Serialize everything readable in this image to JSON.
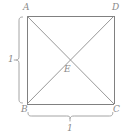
{
  "figure": {
    "kind": "geometry-diagram",
    "background_color": "#ffffff",
    "stroke_color": "#808080",
    "label_color": "#8a8a8a",
    "width": 131,
    "height": 136,
    "square": {
      "name": "ABCD",
      "top_left": {
        "label": "A",
        "x": 27,
        "y": 16
      },
      "top_right": {
        "label": "D",
        "x": 114,
        "y": 16
      },
      "bottom_left": {
        "label": "B",
        "x": 27,
        "y": 104
      },
      "bottom_right": {
        "label": "C",
        "x": 114,
        "y": 104
      }
    },
    "diagonals": [
      {
        "from": "A",
        "to": "C"
      },
      {
        "from": "D",
        "to": "B"
      }
    ],
    "center": {
      "label": "E",
      "x": 70,
      "y": 60
    },
    "dimensions": [
      {
        "name": "left-side-measure",
        "label": "1",
        "orientation": "vertical",
        "spans": "A to B",
        "brace_x": 19,
        "start_y": 17,
        "end_y": 104,
        "tick_y": 60
      },
      {
        "name": "bottom-side-measure",
        "label": "1",
        "orientation": "horizontal",
        "spans": "B to C",
        "brace_y": 117,
        "start_x": 28,
        "end_x": 114,
        "tick_x": 70
      }
    ]
  }
}
